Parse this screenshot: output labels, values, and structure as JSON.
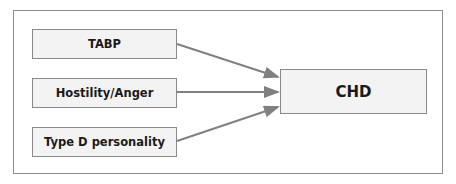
{
  "diagram": {
    "sources": [
      {
        "label": "TABP"
      },
      {
        "label": "Hostility/Anger"
      },
      {
        "label": "Type D personality"
      }
    ],
    "target": {
      "label": "CHD"
    },
    "edges": [
      {
        "from": "TABP",
        "to": "CHD"
      },
      {
        "from": "Hostility/Anger",
        "to": "CHD"
      },
      {
        "from": "Type D personality",
        "to": "CHD"
      }
    ],
    "colors": {
      "box_fill": "#f3f3f3",
      "border": "#8a8a8a",
      "arrow": "#808080"
    }
  }
}
